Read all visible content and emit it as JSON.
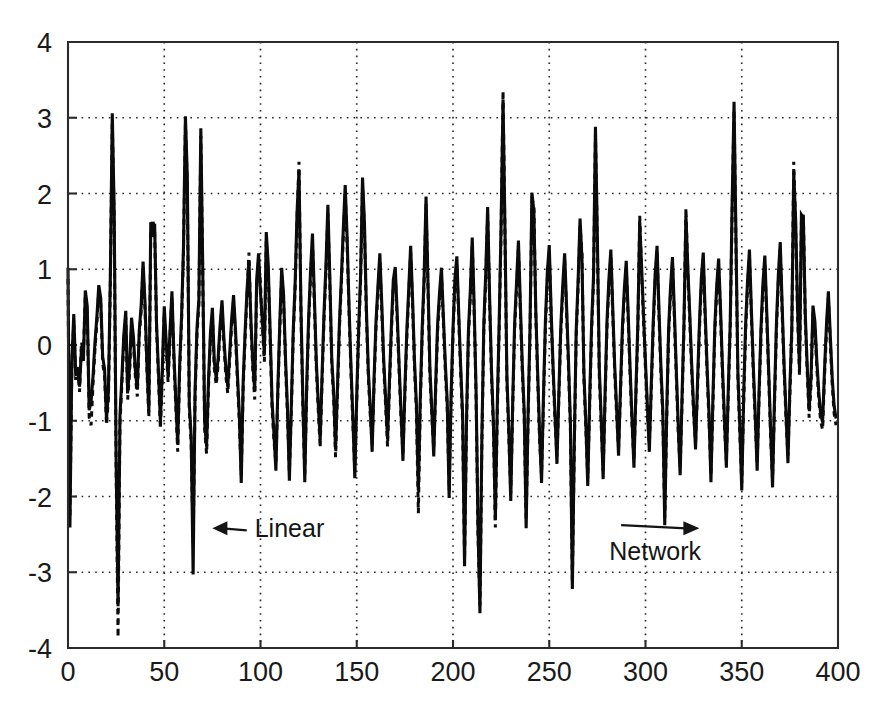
{
  "chart_data": {
    "type": "line",
    "title": "",
    "subtitle": "",
    "xlabel": "",
    "ylabel": "",
    "xlim": [
      0,
      400
    ],
    "ylim": [
      -4,
      4
    ],
    "xticks": [
      0,
      50,
      100,
      150,
      200,
      250,
      300,
      350,
      400
    ],
    "yticks": [
      -4,
      -3,
      -2,
      -1,
      0,
      1,
      2,
      3,
      4
    ],
    "xtick_labels": [
      "0",
      "50",
      "100",
      "150",
      "200",
      "250",
      "300",
      "350",
      "400"
    ],
    "ytick_labels": [
      "-4",
      "-3",
      "-2",
      "-1",
      "0",
      "1",
      "2",
      "3",
      "4"
    ],
    "grid": true,
    "grid_style": "dotted",
    "legend": null,
    "legend_position": "none",
    "annotations": [
      {
        "name": "linear-annotation",
        "text": "Linear",
        "x": 97,
        "y": -2.42,
        "arrow": "left",
        "arrow_target_x": 75,
        "arrow_target_y": -2.42
      },
      {
        "name": "network-annotation",
        "text": "Network",
        "x": 305,
        "y": -2.72,
        "arrow": "right",
        "arrow_target_x": 328,
        "arrow_target_y": -2.42
      }
    ],
    "series": [
      {
        "name": "Linear",
        "style": "solid",
        "color": "#0b0b0b",
        "x_start": 0,
        "x_step": 1,
        "values": [
          1.02,
          -2.41,
          -0.22,
          0.41,
          -0.38,
          -0.35,
          -0.55,
          -0.05,
          -0.21,
          0.72,
          0.51,
          -0.86,
          -0.74,
          -0.41,
          0.03,
          0.37,
          0.79,
          0.62,
          -0.15,
          -0.32,
          -0.98,
          -0.62,
          0.9,
          3.06,
          1.77,
          -1.52,
          -3.45,
          -0.93,
          -0.42,
          0.13,
          0.45,
          -0.63,
          -0.28,
          0.36,
          0.1,
          -0.34,
          -0.59,
          0.18,
          0.52,
          1.1,
          0.56,
          -0.26,
          -0.88,
          1.62,
          1.43,
          1.6,
          0.28,
          -0.35,
          -1.02,
          -0.32,
          0.51,
          0.04,
          -0.41,
          0.19,
          0.71,
          -0.11,
          -0.73,
          -1.31,
          -0.27,
          0.38,
          1.31,
          3.02,
          2.2,
          -0.77,
          -1.22,
          -3.03,
          -0.61,
          0.22,
          0.61,
          2.86,
          1.01,
          -1.03,
          -1.34,
          -0.45,
          0.16,
          0.49,
          -0.22,
          -0.44,
          -0.17,
          0.26,
          0.59,
          0.08,
          -0.31,
          -0.55,
          -0.11,
          0.34,
          0.66,
          0.21,
          -0.38,
          -0.92,
          -1.82,
          -0.48,
          0.17,
          0.73,
          1.12,
          0.34,
          -0.24,
          -0.61,
          0.86,
          1.21,
          0.68,
          0.31,
          -0.13,
          1.49,
          1.07,
          0.18,
          -0.74,
          -1.17,
          -1.66,
          -0.57,
          0.27,
          1.02,
          0.66,
          -0.18,
          -0.83,
          -1.79,
          -0.81,
          0.19,
          0.82,
          1.76,
          2.31,
          0.52,
          -0.71,
          -1.81,
          -0.53,
          0.36,
          0.98,
          1.47,
          0.62,
          -0.22,
          -0.77,
          -1.26,
          -0.38,
          0.43,
          1.05,
          1.85,
          0.91,
          -0.17,
          -0.62,
          -1.38,
          -0.55,
          0.29,
          0.88,
          1.52,
          2.11,
          1.42,
          0.51,
          -0.28,
          -0.96,
          -1.76,
          -0.66,
          0.22,
          0.93,
          2.21,
          1.62,
          0.48,
          -0.33,
          -0.82,
          -1.41,
          -0.44,
          0.31,
          0.77,
          1.21,
          0.54,
          -0.19,
          -0.71,
          -1.24,
          -0.47,
          0.25,
          0.86,
          1.03,
          0.42,
          -0.26,
          -0.88,
          -1.53,
          -0.58,
          0.18,
          0.74,
          1.31,
          0.61,
          -0.21,
          -0.79,
          -1.92,
          -0.72,
          0.22,
          0.91,
          1.96,
          0.83,
          -0.31,
          -0.86,
          -1.47,
          -0.52,
          0.27,
          0.69,
          1.02,
          0.38,
          -0.24,
          -0.75,
          -2.02,
          -0.68,
          0.21,
          0.88,
          1.17,
          0.41,
          -0.29,
          -0.92,
          -2.92,
          -1.02,
          0.18,
          0.72,
          1.42,
          0.51,
          -0.62,
          -2.41,
          -3.54,
          -1.21,
          0.27,
          0.94,
          1.82,
          0.66,
          -0.33,
          -1.02,
          -2.31,
          -0.81,
          0.31,
          1.62,
          3.24,
          1.52,
          -0.41,
          -1.12,
          -2.06,
          -0.77,
          0.28,
          0.82,
          1.38,
          0.52,
          -0.26,
          -0.88,
          -2.42,
          -0.91,
          0.22,
          2.01,
          1.77,
          0.47,
          -0.38,
          -1.18,
          -1.82,
          -0.66,
          0.31,
          0.96,
          1.32,
          0.44,
          -0.29,
          -0.92,
          -1.57,
          -0.62,
          0.24,
          0.78,
          1.21,
          0.51,
          -0.22,
          -1.03,
          -3.22,
          -1.31,
          0.19,
          0.86,
          1.67,
          1.13,
          -0.36,
          -1.02,
          -1.86,
          -0.71,
          0.27,
          0.91,
          2.88,
          1.42,
          -0.31,
          -0.98,
          -1.77,
          -0.64,
          0.32,
          0.87,
          1.26,
          0.48,
          -0.27,
          -0.84,
          -1.46,
          -0.57,
          0.23,
          0.74,
          1.11,
          0.42,
          -0.31,
          -0.97,
          -1.62,
          -0.61,
          0.26,
          1.62,
          1.02,
          0.38,
          -0.24,
          -0.81,
          -1.41,
          -0.52,
          0.29,
          0.93,
          1.31,
          0.46,
          -0.28,
          -0.87,
          -2.38,
          -0.92,
          0.21,
          0.76,
          1.16,
          0.44,
          -0.33,
          -1.06,
          -1.72,
          -0.66,
          0.31,
          1.71,
          1.02,
          0.41,
          -0.26,
          -0.83,
          -1.38,
          -0.51,
          0.27,
          0.88,
          1.22,
          0.43,
          -0.29,
          -0.91,
          -1.81,
          -0.72,
          0.24,
          0.79,
          1.14,
          0.46,
          -0.31,
          -0.96,
          -1.62,
          -0.58,
          0.28,
          1.86,
          3.21,
          1.41,
          -0.37,
          -1.08,
          -1.92,
          -0.68,
          0.26,
          0.84,
          1.26,
          0.47,
          -0.28,
          -0.92,
          -1.66,
          -0.61,
          0.23,
          0.81,
          1.18,
          0.43,
          -0.34,
          -1.12,
          -1.88,
          -0.71,
          0.27,
          0.92,
          1.36,
          0.51,
          -0.26,
          -0.89,
          -1.56,
          -0.56,
          0.22,
          2.28,
          1.66,
          0.48,
          -0.31,
          1.72,
          1.68,
          0.41,
          -0.27,
          -0.86,
          -0.42,
          0.52,
          0.31,
          -0.21,
          -0.62,
          -0.91,
          -1.02,
          -0.33,
          0.26,
          0.71,
          0.12,
          -0.44,
          -0.81,
          -0.97
        ]
      },
      {
        "name": "Network",
        "style": "dashed",
        "color": "#0b0b0b",
        "x_start": 0,
        "x_step": 1,
        "values": [
          0.87,
          -2.28,
          -0.31,
          0.33,
          -0.46,
          -0.27,
          -0.62,
          0.04,
          -0.12,
          0.66,
          0.42,
          -0.95,
          -1.06,
          -0.52,
          -0.06,
          0.29,
          0.71,
          0.54,
          -0.24,
          -0.41,
          -1.06,
          -0.71,
          0.82,
          2.94,
          1.62,
          -1.68,
          -3.86,
          -1.04,
          -0.51,
          0.06,
          0.37,
          -0.72,
          -0.36,
          0.28,
          0.02,
          -0.42,
          -0.68,
          0.11,
          0.44,
          1.02,
          0.47,
          -0.34,
          -0.96,
          1.52,
          1.66,
          1.51,
          0.21,
          -0.44,
          -1.11,
          -0.41,
          0.43,
          -0.04,
          -0.49,
          0.12,
          0.63,
          -0.19,
          -0.82,
          -1.41,
          -0.36,
          0.31,
          1.22,
          2.91,
          2.08,
          -0.86,
          -1.32,
          -2.62,
          -0.71,
          0.14,
          0.53,
          2.76,
          0.92,
          -1.12,
          -1.44,
          -0.54,
          0.08,
          0.41,
          -0.31,
          -0.53,
          -0.26,
          0.18,
          0.51,
          -0.01,
          -0.41,
          -0.64,
          -0.21,
          0.26,
          0.58,
          0.13,
          -0.47,
          -1.02,
          -1.72,
          -0.57,
          0.09,
          0.65,
          1.22,
          0.26,
          -0.33,
          -0.72,
          0.76,
          1.11,
          0.81,
          0.22,
          -0.22,
          1.38,
          0.97,
          0.09,
          -0.84,
          -1.27,
          -1.56,
          -0.66,
          0.18,
          0.93,
          0.57,
          -0.27,
          -0.92,
          -1.68,
          -0.91,
          0.11,
          0.73,
          1.66,
          2.42,
          0.43,
          -0.81,
          -1.71,
          -0.62,
          0.27,
          0.89,
          1.36,
          0.53,
          -0.31,
          -0.86,
          -1.36,
          -0.47,
          0.34,
          0.96,
          1.74,
          0.82,
          -0.26,
          -0.71,
          -1.48,
          -0.64,
          0.21,
          0.79,
          1.41,
          2.02,
          1.31,
          0.42,
          -0.37,
          -1.06,
          -1.66,
          -0.75,
          0.13,
          0.84,
          2.11,
          1.51,
          0.39,
          -0.42,
          -0.92,
          -1.31,
          -0.53,
          0.22,
          0.68,
          1.12,
          0.45,
          -0.28,
          -0.81,
          -1.34,
          -0.56,
          0.16,
          0.77,
          0.94,
          0.33,
          -0.35,
          -0.97,
          -1.43,
          -0.67,
          0.09,
          0.65,
          1.22,
          0.52,
          -0.31,
          -0.88,
          -2.22,
          -0.81,
          0.13,
          0.82,
          1.86,
          0.74,
          -0.41,
          -0.95,
          -1.37,
          -0.61,
          0.18,
          0.61,
          0.93,
          0.29,
          -0.34,
          -0.84,
          -1.92,
          -0.77,
          0.12,
          0.79,
          1.08,
          0.32,
          -0.38,
          -1.01,
          -2.82,
          -1.11,
          0.09,
          0.63,
          1.33,
          0.42,
          -0.71,
          -2.52,
          -3.44,
          -1.31,
          0.18,
          0.85,
          1.72,
          0.57,
          -0.42,
          -1.11,
          -2.41,
          -0.92,
          0.22,
          1.52,
          3.36,
          1.42,
          -0.51,
          -1.22,
          -1.96,
          -0.86,
          0.19,
          0.73,
          1.29,
          0.43,
          -0.36,
          -0.97,
          -2.32,
          -1.01,
          0.13,
          1.91,
          1.87,
          0.38,
          -0.47,
          -1.27,
          -1.72,
          -0.76,
          0.22,
          0.87,
          1.23,
          0.35,
          -0.38,
          -1.01,
          -1.47,
          -0.71,
          0.15,
          0.69,
          1.12,
          0.42,
          -0.31,
          -1.12,
          -3.12,
          -1.41,
          0.11,
          0.77,
          1.57,
          1.22,
          -0.45,
          -1.11,
          -1.76,
          -0.81,
          0.18,
          0.82,
          2.78,
          1.32,
          -0.41,
          -1.07,
          -1.67,
          -0.73,
          0.23,
          0.78,
          1.17,
          0.39,
          -0.36,
          -0.93,
          -1.36,
          -0.66,
          0.14,
          0.65,
          1.02,
          0.33,
          -0.41,
          -1.06,
          -1.52,
          -0.71,
          0.17,
          1.71,
          0.93,
          0.29,
          -0.33,
          -0.91,
          -1.31,
          -0.61,
          0.21,
          0.84,
          1.22,
          0.37,
          -0.37,
          -0.96,
          -2.28,
          -1.02,
          0.12,
          0.67,
          1.07,
          0.35,
          -0.42,
          -1.16,
          -1.62,
          -0.76,
          0.22,
          1.81,
          0.93,
          0.32,
          -0.35,
          -0.92,
          -1.28,
          -0.61,
          0.18,
          0.79,
          1.13,
          0.34,
          -0.38,
          -1.01,
          -1.71,
          -0.82,
          0.15,
          0.7,
          1.05,
          0.37,
          -0.41,
          -1.06,
          -1.52,
          -0.68,
          0.19,
          1.76,
          3.11,
          1.31,
          -0.46,
          -1.18,
          -1.82,
          -0.78,
          0.17,
          0.75,
          1.17,
          0.38,
          -0.37,
          -1.02,
          -1.56,
          -0.71,
          0.14,
          0.72,
          1.09,
          0.34,
          -0.43,
          -1.22,
          -1.78,
          -0.81,
          0.18,
          0.83,
          1.27,
          0.42,
          -0.35,
          -0.99,
          -1.46,
          -0.66,
          0.13,
          2.42,
          1.56,
          0.39,
          -0.41,
          1.62,
          1.72,
          0.32,
          -0.36,
          -0.96,
          -0.52,
          0.43,
          0.22,
          -0.31,
          -0.71,
          -1.01,
          -1.12,
          -0.42,
          0.17,
          0.62,
          0.03,
          -0.53,
          -0.91,
          -1.06
        ]
      }
    ]
  },
  "plot_geometry": {
    "left": 68,
    "top": 42,
    "right": 838,
    "bottom": 648
  }
}
